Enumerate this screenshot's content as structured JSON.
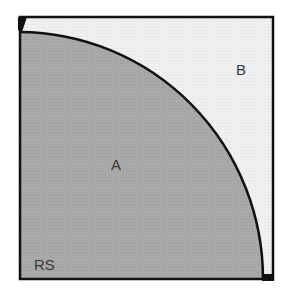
{
  "diagram": {
    "regions": [
      {
        "id": "A",
        "label": "A",
        "description": "quarter-circle region",
        "fill": "#a6a6a6"
      },
      {
        "id": "B",
        "label": "B",
        "description": "remaining square region",
        "fill": "#eeeeee"
      }
    ],
    "corner_label": "RS",
    "colors": {
      "outline": "#111111",
      "region_a": "#a6a6a6",
      "region_b": "#eeeeee"
    }
  }
}
